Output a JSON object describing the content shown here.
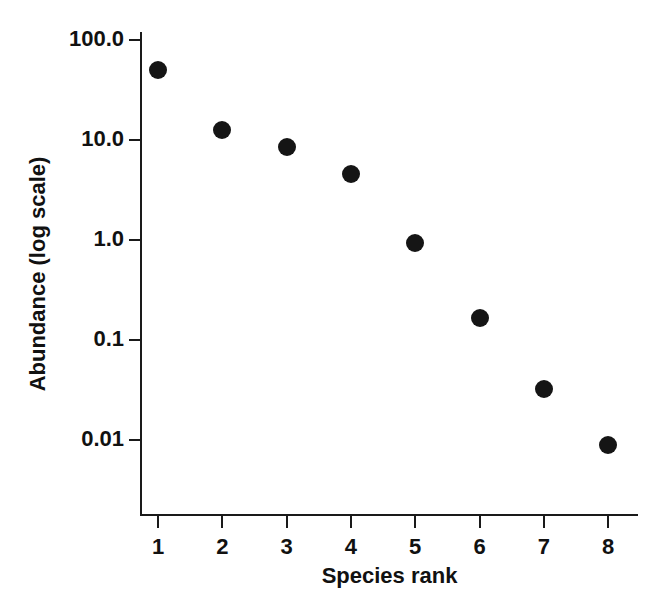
{
  "chart_data": {
    "type": "scatter",
    "title": "",
    "xlabel": "Species rank",
    "ylabel": "Abundance (log scale)",
    "yscale": "log",
    "xscale": "linear",
    "grid": false,
    "legend": null,
    "marker": {
      "shape": "circle",
      "color": "#151515",
      "size_px": 18
    },
    "background_color": "#ffffff",
    "axis_color": "#1a1a1a",
    "xlim": [
      0.65,
      8.6
    ],
    "ylim": [
      0.0063,
      158
    ],
    "x_tick_labels": [
      "1",
      "2",
      "3",
      "4",
      "5",
      "6",
      "7",
      "8"
    ],
    "x": [
      1,
      2,
      3,
      4,
      5,
      6,
      7,
      8
    ],
    "y_tick_labels": [
      "100.0",
      "10.0",
      "1.0",
      "0.1",
      "0.01"
    ],
    "y_ticks": [
      100.0,
      10.0,
      1.0,
      0.1,
      0.01
    ],
    "categories": [
      "1",
      "2",
      "3",
      "4",
      "5",
      "6",
      "7",
      "8"
    ],
    "values": [
      50.0,
      12.6,
      8.5,
      4.6,
      0.93,
      0.166,
      0.032,
      0.0089
    ],
    "points": [
      {
        "rank": "1",
        "abundance": 50.0
      },
      {
        "rank": "2",
        "abundance": 12.6
      },
      {
        "rank": "3",
        "abundance": 8.5
      },
      {
        "rank": "4",
        "abundance": 4.6
      },
      {
        "rank": "5",
        "abundance": 0.93
      },
      {
        "rank": "6",
        "abundance": 0.166
      },
      {
        "rank": "7",
        "abundance": 0.032
      },
      {
        "rank": "8",
        "abundance": 0.0089
      }
    ]
  }
}
